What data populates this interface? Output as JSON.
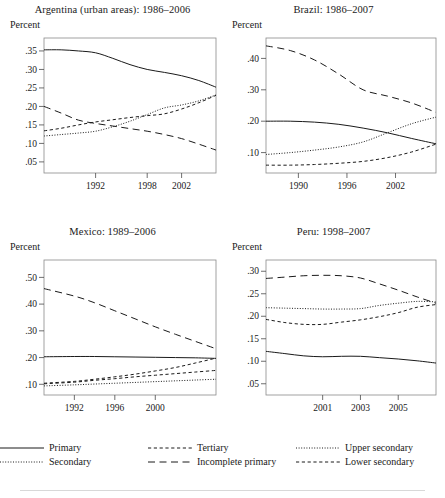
{
  "figure": {
    "y_axis_unit_label": "Percent"
  },
  "legend": {
    "items": [
      {
        "label": "Primary",
        "style": "solid",
        "name": "legend-primary"
      },
      {
        "label": "Tertiary",
        "style": "dashed-sm",
        "name": "legend-tertiary"
      },
      {
        "label": "Upper secondary",
        "style": "dotted",
        "name": "legend-upper-secondary"
      },
      {
        "label": "Secondary",
        "style": "dotted",
        "name": "legend-secondary"
      },
      {
        "label": "Incomplete primary",
        "style": "dashed-lg",
        "name": "legend-incomplete-primary"
      },
      {
        "label": "Lower secondary",
        "style": "dashed-sm",
        "name": "legend-lower-secondary"
      }
    ]
  },
  "chart_data": [
    {
      "type": "line",
      "name": "argentina",
      "title": "Argentina (urban areas): 1986–2006",
      "xlabel": "",
      "ylabel": "Percent",
      "xlim": [
        1986,
        2006
      ],
      "ylim": [
        0.02,
        0.385
      ],
      "xticks": [
        1992,
        1998,
        2002
      ],
      "xtick_labels": [
        "1992",
        "1998",
        "2002"
      ],
      "yticks": [
        0.05,
        0.1,
        0.15,
        0.2,
        0.25,
        0.3,
        0.35
      ],
      "ytick_labels": [
        ".05",
        ".10",
        ".15",
        ".20",
        ".25",
        ".30",
        ".35"
      ],
      "x": [
        1986,
        1988,
        1990,
        1992,
        1994,
        1996,
        1998,
        2000,
        2002,
        2004,
        2006
      ],
      "series": [
        {
          "name": "Primary",
          "style": "solid",
          "values": [
            0.353,
            0.353,
            0.35,
            0.345,
            0.33,
            0.313,
            0.3,
            0.292,
            0.283,
            0.27,
            0.252
          ]
        },
        {
          "name": "Secondary",
          "style": "dotted",
          "values": [
            0.12,
            0.124,
            0.128,
            0.133,
            0.145,
            0.16,
            0.178,
            0.196,
            0.204,
            0.215,
            0.231
          ]
        },
        {
          "name": "Tertiary",
          "style": "dashed-sm",
          "values": [
            0.134,
            0.141,
            0.15,
            0.158,
            0.164,
            0.17,
            0.175,
            0.18,
            0.193,
            0.21,
            0.23
          ]
        },
        {
          "name": "Incomplete primary",
          "style": "dashed-lg",
          "values": [
            0.2,
            0.182,
            0.163,
            0.154,
            0.147,
            0.14,
            0.133,
            0.124,
            0.113,
            0.098,
            0.082
          ]
        }
      ]
    },
    {
      "type": "line",
      "name": "brazil",
      "title": "Brazil: 1986–2007",
      "xlabel": "",
      "ylabel": "Percent",
      "xlim": [
        1986,
        2007
      ],
      "ylim": [
        0.035,
        0.465
      ],
      "xticks": [
        1990,
        1996,
        2002
      ],
      "xtick_labels": [
        "1990",
        "1996",
        "2002"
      ],
      "yticks": [
        0.1,
        0.2,
        0.3,
        0.4
      ],
      "ytick_labels": [
        ".10",
        ".20",
        ".30",
        ".40"
      ],
      "x": [
        1986,
        1989,
        1992,
        1995,
        1998,
        2001,
        2004,
        2007
      ],
      "series": [
        {
          "name": "Incomplete primary",
          "style": "dashed-lg",
          "values": [
            0.44,
            0.425,
            0.395,
            0.35,
            0.3,
            0.28,
            0.258,
            0.228
          ]
        },
        {
          "name": "Primary",
          "style": "solid",
          "values": [
            0.2,
            0.2,
            0.197,
            0.19,
            0.178,
            0.163,
            0.145,
            0.128
          ]
        },
        {
          "name": "Secondary",
          "style": "dotted",
          "values": [
            0.094,
            0.1,
            0.108,
            0.118,
            0.134,
            0.163,
            0.192,
            0.213
          ]
        },
        {
          "name": "Tertiary",
          "style": "dashed-sm",
          "values": [
            0.06,
            0.06,
            0.062,
            0.066,
            0.072,
            0.084,
            0.102,
            0.127
          ]
        }
      ]
    },
    {
      "type": "line",
      "name": "mexico",
      "title": "Mexico: 1989–2006",
      "xlabel": "",
      "ylabel": "Percent",
      "xlim": [
        1989,
        2006
      ],
      "ylim": [
        0.06,
        0.565
      ],
      "xticks": [
        1992,
        1996,
        2000
      ],
      "xtick_labels": [
        "1992",
        "1996",
        "2000"
      ],
      "yticks": [
        0.1,
        0.2,
        0.3,
        0.4,
        0.5
      ],
      "ytick_labels": [
        ".10",
        ".20",
        ".30",
        ".40",
        ".50"
      ],
      "x": [
        1989,
        1992,
        1994,
        1996,
        1998,
        2000,
        2002,
        2004,
        2006
      ],
      "series": [
        {
          "name": "Incomplete primary",
          "style": "dashed-lg",
          "values": [
            0.458,
            0.43,
            0.405,
            0.375,
            0.345,
            0.315,
            0.287,
            0.26,
            0.233
          ]
        },
        {
          "name": "Primary",
          "style": "solid",
          "values": [
            0.203,
            0.204,
            0.204,
            0.203,
            0.202,
            0.201,
            0.2,
            0.199,
            0.197
          ]
        },
        {
          "name": "Tertiary",
          "style": "dashed-sm",
          "values": [
            0.104,
            0.111,
            0.119,
            0.128,
            0.138,
            0.15,
            0.163,
            0.18,
            0.198
          ]
        },
        {
          "name": "Lower secondary",
          "style": "dashed-sm",
          "values": [
            0.102,
            0.108,
            0.115,
            0.121,
            0.128,
            0.134,
            0.14,
            0.146,
            0.152
          ]
        },
        {
          "name": "Secondary",
          "style": "dotted",
          "values": [
            0.094,
            0.098,
            0.101,
            0.104,
            0.107,
            0.11,
            0.113,
            0.116,
            0.119
          ]
        }
      ]
    },
    {
      "type": "line",
      "name": "peru",
      "title": "Peru: 1998–2007",
      "xlabel": "",
      "ylabel": "Percent",
      "xlim": [
        1998,
        2007
      ],
      "ylim": [
        0.025,
        0.325
      ],
      "xticks": [
        2001,
        2003,
        2005
      ],
      "xtick_labels": [
        "2001",
        "2003",
        "2005"
      ],
      "yticks": [
        0.05,
        0.1,
        0.15,
        0.2,
        0.25,
        0.3
      ],
      "ytick_labels": [
        ".05",
        ".10",
        ".15",
        ".20",
        ".25",
        ".30"
      ],
      "x": [
        1998,
        1999,
        2000,
        2001,
        2002,
        2003,
        2004,
        2005,
        2006,
        2007
      ],
      "series": [
        {
          "name": "Incomplete primary",
          "style": "dashed-lg",
          "values": [
            0.284,
            0.287,
            0.29,
            0.291,
            0.29,
            0.285,
            0.272,
            0.258,
            0.243,
            0.229
          ]
        },
        {
          "name": "Upper secondary",
          "style": "dotted",
          "values": [
            0.219,
            0.218,
            0.217,
            0.216,
            0.216,
            0.217,
            0.224,
            0.229,
            0.233,
            0.232
          ]
        },
        {
          "name": "Lower secondary",
          "style": "dashed-sm",
          "values": [
            0.193,
            0.186,
            0.182,
            0.182,
            0.187,
            0.192,
            0.199,
            0.208,
            0.22,
            0.226
          ]
        },
        {
          "name": "Primary",
          "style": "solid",
          "values": [
            0.122,
            0.117,
            0.112,
            0.11,
            0.111,
            0.111,
            0.108,
            0.105,
            0.101,
            0.096
          ]
        }
      ]
    }
  ]
}
